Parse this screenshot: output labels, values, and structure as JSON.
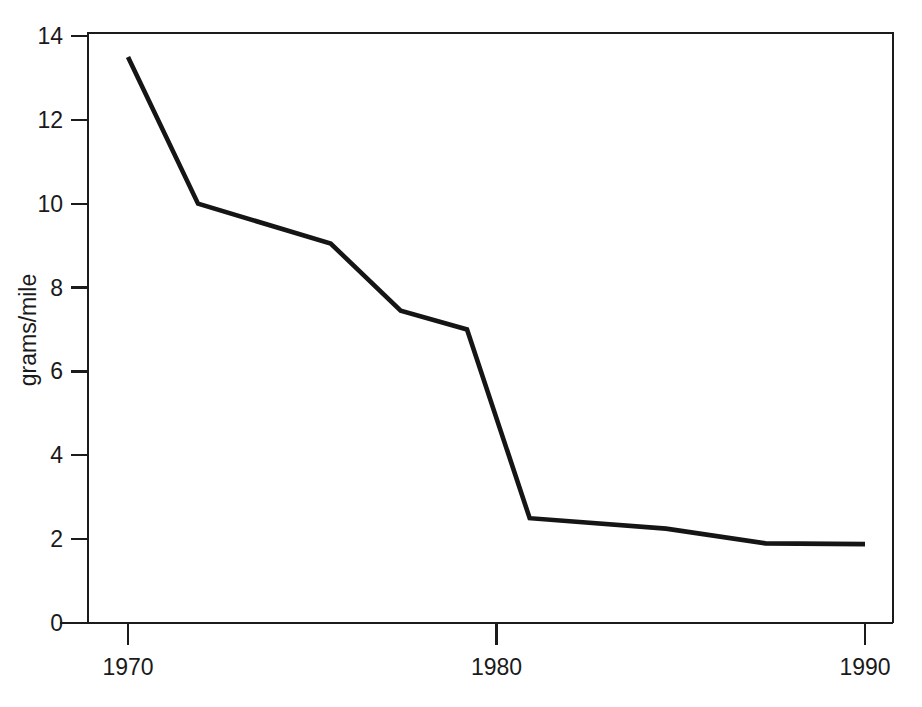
{
  "chart_data": {
    "type": "line",
    "title": "",
    "subtitle": "",
    "xlabel": "",
    "ylabel": "grams/mile",
    "xlim": [
      1969,
      1990.6
    ],
    "ylim": [
      0,
      14
    ],
    "xticks": [
      1970,
      1980,
      1990
    ],
    "xtick_labels": [
      "1970",
      "1980",
      "1990"
    ],
    "yticks": [
      0,
      2,
      4,
      6,
      8,
      10,
      12,
      14
    ],
    "ytick_labels": [
      "0",
      "2",
      "4",
      "6",
      "8",
      "10",
      "12",
      "14"
    ],
    "grid": false,
    "legend": null,
    "legend_position": "none",
    "annotations": [],
    "series": [
      {
        "name": "grams/mile",
        "color": "#151515",
        "x": [
          1970.0,
          1971.9,
          1975.5,
          1977.4,
          1979.2,
          1980.9,
          1984.6,
          1987.3,
          1990.0
        ],
        "y": [
          13.5,
          10.0,
          9.05,
          7.45,
          7.0,
          2.5,
          2.25,
          1.9,
          1.88
        ],
        "points": [
          {
            "x": 1970.0,
            "y": 13.5
          },
          {
            "x": 1971.9,
            "y": 10.0
          },
          {
            "x": 1975.5,
            "y": 9.05
          },
          {
            "x": 1977.4,
            "y": 7.45
          },
          {
            "x": 1979.2,
            "y": 7.0
          },
          {
            "x": 1980.9,
            "y": 2.5
          },
          {
            "x": 1984.6,
            "y": 2.25
          },
          {
            "x": 1987.3,
            "y": 1.9
          },
          {
            "x": 1990.0,
            "y": 1.88
          }
        ]
      }
    ]
  },
  "axes": {
    "y_axis_title": "grams/mile",
    "x_axis_title": ""
  },
  "colors": {
    "background": "#ffffff",
    "axis": "#1b1b1b",
    "line": "#151515",
    "text": "#1a1a1a"
  }
}
